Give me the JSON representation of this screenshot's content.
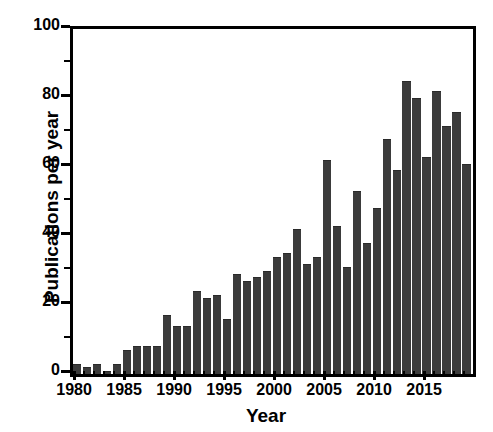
{
  "chart_data": {
    "type": "bar",
    "title": "",
    "xlabel": "Year",
    "ylabel": "Publications per year",
    "xlim": [
      1979.5,
      2019.5
    ],
    "ylim": [
      0,
      100
    ],
    "grid": false,
    "legend": null,
    "bar_color": "#3b3b3b",
    "axis_color": "#000000",
    "background_color": "#ffffff",
    "y_major_ticks": [
      0,
      20,
      40,
      60,
      80,
      100
    ],
    "y_minor_ticks": [
      10,
      30,
      50,
      70,
      90
    ],
    "y_tick_labels": [
      "0",
      "20",
      "40",
      "60",
      "80",
      "100"
    ],
    "x_major_ticks": [
      1980,
      1985,
      1990,
      1995,
      2000,
      2005,
      2010,
      2015
    ],
    "x_tick_labels": [
      "1980",
      "1985",
      "1990",
      "1995",
      "2000",
      "2005",
      "2010",
      "2015"
    ],
    "categories": [
      "1980",
      "1981",
      "1982",
      "1983",
      "1984",
      "1985",
      "1986",
      "1987",
      "1988",
      "1989",
      "1990",
      "1991",
      "1992",
      "1993",
      "1994",
      "1995",
      "1996",
      "1997",
      "1998",
      "1999",
      "2000",
      "2001",
      "2002",
      "2003",
      "2004",
      "2005",
      "2006",
      "2007",
      "2008",
      "2009",
      "2010",
      "2011",
      "2012",
      "2013",
      "2014",
      "2015",
      "2016",
      "2017",
      "2018",
      "2019"
    ],
    "values": [
      3,
      2,
      3,
      1,
      3,
      7,
      8,
      8,
      8,
      17,
      14,
      14,
      24,
      22,
      23,
      16,
      29,
      27,
      28,
      30,
      34,
      35,
      42,
      32,
      34,
      62,
      43,
      31,
      53,
      38,
      48,
      68,
      59,
      85,
      80,
      63,
      82,
      72,
      76,
      61
    ]
  }
}
